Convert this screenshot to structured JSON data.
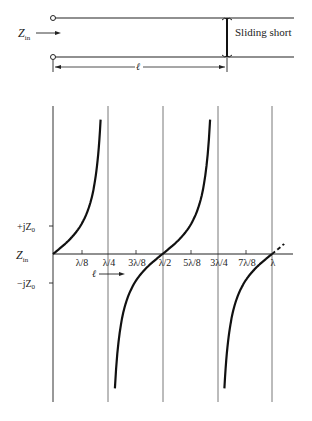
{
  "line_diagram": {
    "input_label": "Z",
    "input_label_sub": "in",
    "short_label": "Sliding short",
    "length_label": "ℓ"
  },
  "plot": {
    "y_axis_label": "Z",
    "y_axis_label_sub": "in",
    "y_ticks": [
      {
        "label": "+jZ",
        "sub": "0",
        "value": 1
      },
      {
        "label": "−jZ",
        "sub": "0",
        "value": -1
      }
    ],
    "x_ticks": [
      "λ/8",
      "λ/4",
      "3λ/8",
      "λ/2",
      "5λ/8",
      "3λ/4",
      "7λ/8",
      "λ"
    ],
    "length_arrow_label": "ℓ"
  },
  "chart_data": {
    "type": "line",
    "title": "",
    "xlabel": "ℓ",
    "ylabel": "Z_in",
    "function": "Z_in = jZ0·tan(2πℓ/λ)",
    "x_ticks": [
      "λ/8",
      "λ/4",
      "3λ/8",
      "λ/2",
      "5λ/8",
      "3λ/4",
      "7λ/8",
      "λ"
    ],
    "x_range_lambda": [
      0,
      1.0
    ],
    "y_ticks": [
      "+jZ0",
      "-jZ0"
    ],
    "asymptotes_lambda": [
      0.25,
      0.5,
      0.75,
      1.0
    ],
    "series": [
      {
        "name": "Z_in/jZ0",
        "x_lambda": [
          0,
          0.0625,
          0.125,
          0.1875,
          0.22,
          0.234
        ],
        "values": [
          0,
          0.41,
          1.0,
          2.41,
          5.0,
          4.8
        ]
      },
      {
        "name": "Z_in/jZ0 (branch 2)",
        "x_lambda": [
          0.266,
          0.3125,
          0.375,
          0.4375,
          0.5,
          0.5625,
          0.625,
          0.6875,
          0.734
        ],
        "values": [
          -4.8,
          -2.41,
          -1.0,
          -0.41,
          0,
          0.41,
          1.0,
          2.41,
          4.8
        ]
      },
      {
        "name": "Z_in/jZ0 (branch 3)",
        "x_lambda": [
          0.766,
          0.8125,
          0.875,
          0.9375,
          1.0,
          1.05
        ],
        "values": [
          -4.8,
          -2.41,
          -1.0,
          -0.41,
          0,
          0.3
        ]
      }
    ],
    "grid": false,
    "legend": null
  }
}
